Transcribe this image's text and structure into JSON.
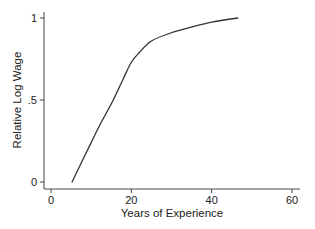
{
  "chart_data": {
    "type": "line",
    "title": "",
    "xlabel": "Years of Experience",
    "ylabel": "Relative Log Wage",
    "xlim": [
      0,
      60
    ],
    "ylim": [
      0,
      1
    ],
    "xticks": [
      0,
      20,
      40,
      60
    ],
    "xtick_labels": [
      "0",
      "20",
      "40",
      "60"
    ],
    "yticks": [
      0,
      0.5,
      1
    ],
    "ytick_labels": [
      "0",
      ".5",
      "1"
    ],
    "grid": false,
    "legend": null,
    "series": [
      {
        "name": "Relative Log Wage",
        "color": "#333333",
        "x": [
          5.25,
          8,
          10,
          12,
          15.5,
          18,
          20,
          22,
          25,
          30,
          35,
          40,
          46.5
        ],
        "y": [
          0.0,
          0.14,
          0.24,
          0.34,
          0.5,
          0.63,
          0.73,
          0.79,
          0.86,
          0.91,
          0.945,
          0.975,
          1.0
        ]
      }
    ]
  }
}
